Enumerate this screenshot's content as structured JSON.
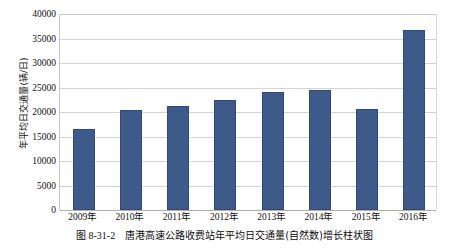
{
  "chart_data": {
    "type": "bar",
    "title": "",
    "xlabel": "",
    "ylabel": "年平均日交通量(辆/日)",
    "ylim": [
      0,
      40000
    ],
    "ytick_interval": 5000,
    "yticks": [
      "40000",
      "35000",
      "30000",
      "25000",
      "20000",
      "15000",
      "10000",
      "5000",
      "0"
    ],
    "grid": true,
    "legend": "none",
    "bar_color": "#3d5a8a",
    "gridline_color": "#d4d4d4",
    "categories": [
      "2009年",
      "2010年",
      "2011年",
      "2012年",
      "2013年",
      "2014年",
      "2015年",
      "2016年"
    ],
    "values": [
      16600,
      20500,
      21300,
      22400,
      24000,
      24500,
      20600,
      36700
    ]
  },
  "caption": {
    "figure_number": "图 8-31-2",
    "text": "唐港高速公路收费站年平均日交通量(自然数)增长柱状图"
  }
}
